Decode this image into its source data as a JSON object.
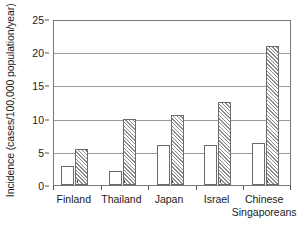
{
  "chart_data": {
    "type": "bar",
    "title": "",
    "subtitle": "",
    "xlabel": "",
    "ylabel": "Incidence (cases/100,000 population/year)",
    "categories": [
      "Finland",
      "Thailand",
      "Japan",
      "Israel",
      "Chinese Singaporeans"
    ],
    "category_lines": [
      [
        "Finland"
      ],
      [
        "Thailand"
      ],
      [
        "Japan"
      ],
      [
        "Israel"
      ],
      [
        "Chinese",
        "Singaporeans"
      ]
    ],
    "series": [
      {
        "name": "series-1-open",
        "style": "open",
        "values": [
          2.9,
          2.1,
          6.0,
          6.1,
          6.4
        ]
      },
      {
        "name": "series-2-hatched",
        "style": "hatched",
        "values": [
          5.4,
          10.0,
          10.5,
          12.5,
          21.0
        ]
      }
    ],
    "ylim": [
      0,
      25
    ],
    "yticks": [
      0,
      5,
      10,
      15,
      20,
      25
    ],
    "ytick_labels": [
      "0",
      "5",
      "10",
      "15",
      "20",
      "25"
    ],
    "grid": true,
    "grid_axis": "y",
    "legend": false,
    "legend_position": "none",
    "colors": {
      "bar_outline": "#6b6b6b",
      "bar_fill_open": "#ffffff",
      "bar_hatch": "#8d8d8d",
      "gridline": "#9a9a9a",
      "axis": "#777777",
      "text": "#1a1a1a",
      "background": "#ffffff"
    }
  }
}
